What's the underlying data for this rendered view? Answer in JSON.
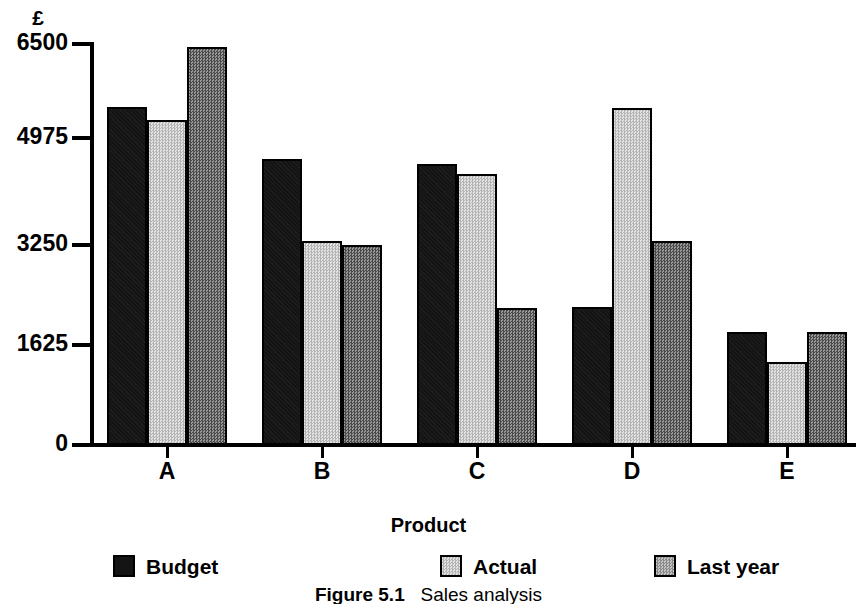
{
  "chart_data": {
    "type": "bar",
    "title": "",
    "caption_number": "Figure 5.1",
    "caption_text": "Sales analysis",
    "xlabel": "Product",
    "ylabel": "£",
    "categories": [
      "A",
      "B",
      "C",
      "D",
      "E"
    ],
    "ylim": [
      0,
      6500
    ],
    "yticks": [
      0,
      1625,
      3250,
      4975,
      6500
    ],
    "ytick_labels": [
      "0",
      "1625",
      "3250",
      "4975",
      "6500"
    ],
    "grid": false,
    "legend_position": "bottom",
    "series": [
      {
        "name": "Budget",
        "color": "#141414",
        "pattern": "solid-black",
        "values": [
          5485,
          4635,
          4550,
          2240,
          1835
        ]
      },
      {
        "name": "Actual",
        "color": "#c9c9c9",
        "pattern": "light-checker",
        "values": [
          5270,
          3305,
          4385,
          5470,
          1340
        ]
      },
      {
        "name": "Last year",
        "color": "#707070",
        "pattern": "dark-checker",
        "values": [
          6450,
          3240,
          2225,
          3305,
          1835
        ]
      }
    ]
  },
  "axis": {
    "y_unit": "£",
    "x_title": "Product"
  },
  "legend": {
    "items": [
      {
        "label": "Budget"
      },
      {
        "label": "Actual"
      },
      {
        "label": "Last year"
      }
    ]
  },
  "caption": {
    "number": "Figure 5.1",
    "text": "Sales analysis"
  }
}
